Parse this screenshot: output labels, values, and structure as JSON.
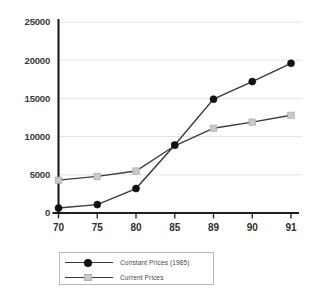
{
  "chart_data": {
    "type": "line",
    "title": "",
    "subtitle": "",
    "xlabel": "",
    "ylabel": "",
    "categories": [
      "70",
      "75",
      "80",
      "85",
      "89",
      "90",
      "91"
    ],
    "ylim": [
      0,
      25000
    ],
    "yticks": [
      0,
      5000,
      10000,
      15000,
      20000,
      25000
    ],
    "ytick_labels": [
      "0",
      "5000",
      "10000",
      "15000",
      "20000",
      "25000"
    ],
    "grid": true,
    "legend_position": "bottom-center",
    "series": [
      {
        "name": "Constant Prices (1985)",
        "marker": "circle",
        "marker_color": "#111111",
        "line_color": "#3b3b3b",
        "values": [
          650,
          1100,
          3200,
          8900,
          14900,
          17200,
          19600
        ]
      },
      {
        "name": "Current Prices",
        "marker": "square",
        "marker_color": "#c9c9c9",
        "line_color": "#3b3b3b",
        "values": [
          4300,
          4800,
          5500,
          8800,
          11100,
          11900,
          12800
        ]
      }
    ]
  },
  "legend": {
    "entries": [
      {
        "label": "Constant Prices (1985)"
      },
      {
        "label": "Current Prices"
      }
    ]
  },
  "colors": {
    "grid": "#e2e2e2",
    "axis": "#1c1c1c",
    "line": "#3b3b3b",
    "constant_marker": "#111111",
    "current_marker": "#c9c9c9",
    "background": "#ffffff"
  }
}
